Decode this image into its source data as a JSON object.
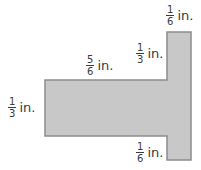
{
  "diagram": {
    "type": "composite-figure",
    "shape": "T-shape rotated (horizontal bar joined to vertical bar)",
    "fill_color": "#c8c8c8",
    "stroke_color": "#8c8c8c",
    "labels": [
      {
        "id": "top-right-width",
        "numerator": "1",
        "denominator": "6",
        "unit": "in."
      },
      {
        "id": "upper-vertical",
        "numerator": "1",
        "denominator": "3",
        "unit": "in."
      },
      {
        "id": "bar-length",
        "numerator": "5",
        "denominator": "6",
        "unit": "in."
      },
      {
        "id": "bar-height",
        "numerator": "1",
        "denominator": "3",
        "unit": "in."
      },
      {
        "id": "lower-vertical",
        "numerator": "1",
        "denominator": "6",
        "unit": "in."
      }
    ]
  }
}
